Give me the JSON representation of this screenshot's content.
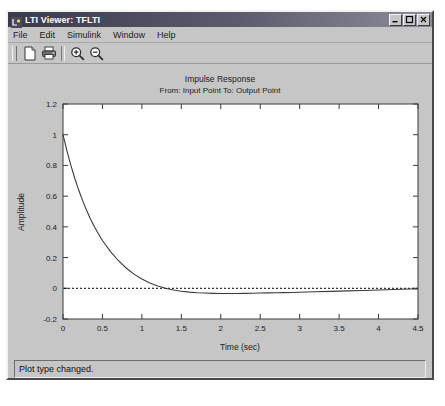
{
  "window": {
    "title": "LTI Viewer: TFLTI",
    "icon": "lti-viewer-icon",
    "controls": {
      "minimize": "_",
      "maximize": "□",
      "close": "✕"
    }
  },
  "menu": {
    "items": [
      {
        "label": "File"
      },
      {
        "label": "Edit"
      },
      {
        "label": "Simulink"
      },
      {
        "label": "Window"
      },
      {
        "label": "Help"
      }
    ]
  },
  "toolbar": {
    "buttons": [
      {
        "name": "new-document-icon",
        "tooltip": "New"
      },
      {
        "name": "print-icon",
        "tooltip": "Print"
      },
      {
        "name": "zoom-in-icon",
        "tooltip": "Zoom In"
      },
      {
        "name": "zoom-out-icon",
        "tooltip": "Zoom Out"
      }
    ]
  },
  "status": {
    "message": "Plot type changed."
  },
  "chart_data": {
    "type": "line",
    "title": "Impulse Response",
    "subtitle": "From: Input Point  To: Output Point",
    "xlabel": "Time (sec)",
    "ylabel": "Amplitude",
    "xlim": [
      0,
      4.5
    ],
    "ylim": [
      -0.2,
      1.2
    ],
    "xticks": [
      "0",
      "0.5",
      "1",
      "1.5",
      "2",
      "2.5",
      "3",
      "3.5",
      "4",
      "4.5"
    ],
    "xtick_values": [
      0,
      0.5,
      1,
      1.5,
      2,
      2.5,
      3,
      3.5,
      4,
      4.5
    ],
    "yticks": [
      "-0.2",
      "0",
      "0.2",
      "0.4",
      "0.6",
      "0.8",
      "1",
      "1.2"
    ],
    "ytick_values": [
      -0.2,
      0,
      0.2,
      0.4,
      0.6,
      0.8,
      1,
      1.2
    ],
    "grid": false,
    "legend": null,
    "zero_line": {
      "value": 0,
      "style": "dotted",
      "color": "#000000"
    },
    "series": [
      {
        "name": "Impulse Response",
        "color": "#3a3a3a",
        "x": [
          0,
          0.05,
          0.1,
          0.15,
          0.2,
          0.25,
          0.3,
          0.35,
          0.4,
          0.45,
          0.5,
          0.6,
          0.7,
          0.8,
          0.9,
          1.0,
          1.1,
          1.2,
          1.3,
          1.4,
          1.5,
          1.6,
          1.7,
          1.8,
          1.9,
          2.0,
          2.1,
          2.2,
          2.3,
          2.4,
          2.5,
          2.6,
          2.7,
          2.8,
          2.9,
          3.0,
          3.2,
          3.4,
          3.6,
          3.8,
          4.0,
          4.2,
          4.4,
          4.5
        ],
        "y": [
          1.0,
          0.895,
          0.8,
          0.715,
          0.638,
          0.569,
          0.506,
          0.45,
          0.399,
          0.353,
          0.311,
          0.24,
          0.181,
          0.132,
          0.092,
          0.06,
          0.035,
          0.015,
          0.0,
          -0.011,
          -0.019,
          -0.025,
          -0.029,
          -0.031,
          -0.033,
          -0.034,
          -0.034,
          -0.034,
          -0.033,
          -0.032,
          -0.031,
          -0.03,
          -0.029,
          -0.028,
          -0.027,
          -0.026,
          -0.023,
          -0.02,
          -0.017,
          -0.014,
          -0.011,
          -0.008,
          -0.005,
          -0.004
        ]
      }
    ]
  }
}
